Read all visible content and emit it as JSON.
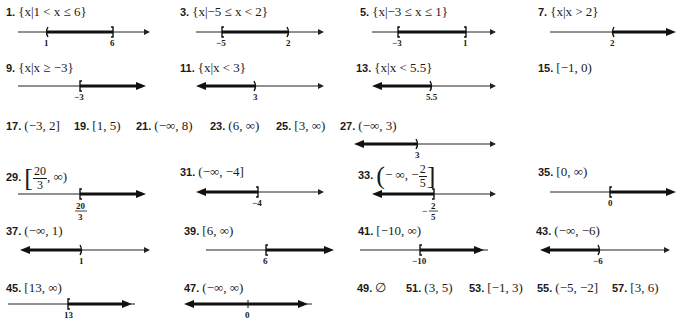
{
  "answers": [
    {
      "n": "1.",
      "expr": "{x|1 < x ≤ 6}"
    },
    {
      "n": "3.",
      "expr": "{x|−5 ≤ x < 2}"
    },
    {
      "n": "5.",
      "expr": "{x|−3 ≤ x ≤ 1}"
    },
    {
      "n": "7.",
      "expr": "{x|x > 2}"
    },
    {
      "n": "9.",
      "expr": "{x|x ≥ −3}"
    },
    {
      "n": "11.",
      "expr": "{x|x < 3}"
    },
    {
      "n": "13.",
      "expr": "{x|x < 5.5}"
    },
    {
      "n": "15.",
      "expr": "[−1, 0)"
    },
    {
      "n": "17.",
      "expr": "(−3, 2]"
    },
    {
      "n": "19.",
      "expr": "[1, 5)"
    },
    {
      "n": "21.",
      "expr": "(−∞, 8)"
    },
    {
      "n": "23.",
      "expr": "(6, ∞)"
    },
    {
      "n": "25.",
      "expr": "[3, ∞)"
    },
    {
      "n": "27.",
      "expr": "(−∞, 3)"
    },
    {
      "n": "29.",
      "expr_parts": {
        "open": "[",
        "num": "20",
        "den": "3",
        "rest": ", ∞)"
      }
    },
    {
      "n": "31.",
      "expr": "(−∞, −4]"
    },
    {
      "n": "33.",
      "expr_parts": {
        "open": "(",
        "lead": "− ∞, −",
        "num": "2",
        "den": "5",
        "close": "]"
      }
    },
    {
      "n": "35.",
      "expr": "[0, ∞)"
    },
    {
      "n": "37.",
      "expr": "(−∞, 1)"
    },
    {
      "n": "39.",
      "expr": "[6, ∞)"
    },
    {
      "n": "41.",
      "expr": "[−10, ∞)"
    },
    {
      "n": "43.",
      "expr": "(−∞, −6)"
    },
    {
      "n": "45.",
      "expr": "[13, ∞)"
    },
    {
      "n": "47.",
      "expr": "(−∞, ∞)"
    },
    {
      "n": "49.",
      "expr": "∅"
    },
    {
      "n": "51.",
      "expr": "(3, 5)"
    },
    {
      "n": "53.",
      "expr": "[−1, 3)"
    },
    {
      "n": "55.",
      "expr": "(−5, −2]"
    },
    {
      "n": "57.",
      "expr": "[3, 6)"
    }
  ],
  "number_lines": {
    "p1": {
      "labels": [
        "1",
        "6"
      ],
      "brackets": [
        "(",
        "]"
      ]
    },
    "p3": {
      "labels": [
        "−5",
        "2"
      ],
      "brackets": [
        "[",
        ")"
      ]
    },
    "p5": {
      "labels": [
        "−3",
        "1"
      ],
      "brackets": [
        "[",
        "]"
      ]
    },
    "p7": {
      "labels": [
        "2"
      ],
      "brackets": [
        "("
      ]
    },
    "p9": {
      "labels": [
        "−3"
      ],
      "brackets": [
        "["
      ]
    },
    "p11": {
      "labels": [
        "3"
      ],
      "brackets": [
        ")"
      ]
    },
    "p13": {
      "labels": [
        "5.5"
      ],
      "brackets": [
        ")"
      ]
    },
    "p27": {
      "labels": [
        "3"
      ],
      "brackets": [
        ")"
      ]
    },
    "p29": {
      "labels": [
        "20",
        "3"
      ],
      "brackets": [
        "["
      ]
    },
    "p31": {
      "labels": [
        "−4"
      ],
      "brackets": [
        "]"
      ]
    },
    "p33": {
      "labels": [
        "−",
        "2",
        "5"
      ],
      "brackets": [
        "]"
      ]
    },
    "p35": {
      "labels": [
        "0"
      ],
      "brackets": [
        "["
      ]
    },
    "p37": {
      "labels": [
        "1"
      ],
      "brackets": [
        ")"
      ]
    },
    "p39": {
      "labels": [
        "6"
      ],
      "brackets": [
        "["
      ]
    },
    "p41": {
      "labels": [
        "−10"
      ],
      "brackets": [
        "["
      ]
    },
    "p43": {
      "labels": [
        "−6"
      ],
      "brackets": [
        ")"
      ]
    },
    "p45": {
      "labels": [
        "13"
      ],
      "brackets": [
        "["
      ]
    },
    "p47": {
      "labels": [
        "0"
      ],
      "brackets": []
    }
  }
}
